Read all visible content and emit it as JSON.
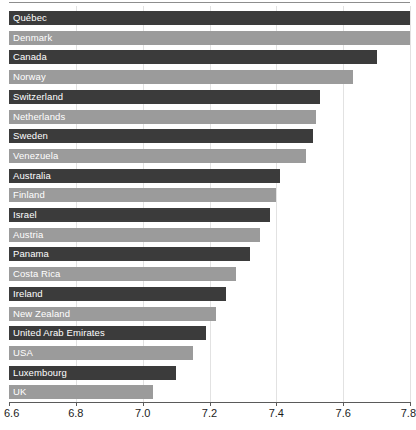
{
  "chart_data": {
    "type": "bar",
    "orientation": "horizontal",
    "title": "",
    "subtitle": "",
    "xlabel": "",
    "ylabel": "",
    "xlim": [
      6.6,
      7.8
    ],
    "xticks": [
      "6.6",
      "6.8",
      "7.0",
      "7.2",
      "7.4",
      "7.6",
      "7.8"
    ],
    "xtick_values": [
      6.6,
      6.8,
      7.0,
      7.2,
      7.4,
      7.6,
      7.8
    ],
    "grid": true,
    "grid_axis": "x",
    "legend": "none",
    "labels_inside_bars": true,
    "categories": [
      "Québec",
      "Denmark",
      "Canada",
      "Norway",
      "Switzerland",
      "Netherlands",
      "Sweden",
      "Venezuela",
      "Australia",
      "Finland",
      "Israel",
      "Austria",
      "Panama",
      "Costa Rica",
      "Ireland",
      "New Zealand",
      "United Arab Emirates",
      "USA",
      "Luxembourg",
      "UK"
    ],
    "values": [
      7.8,
      7.8,
      7.7,
      7.63,
      7.53,
      7.52,
      7.51,
      7.49,
      7.41,
      7.4,
      7.38,
      7.35,
      7.32,
      7.28,
      7.25,
      7.22,
      7.19,
      7.15,
      7.1,
      7.03
    ],
    "bar_colors": [
      "dark",
      "light",
      "dark",
      "light",
      "dark",
      "light",
      "dark",
      "light",
      "dark",
      "light",
      "dark",
      "light",
      "dark",
      "light",
      "dark",
      "light",
      "dark",
      "light",
      "dark",
      "light"
    ]
  },
  "colors": {
    "bar_dark": "#3b3b3b",
    "bar_light": "#9b9b9b",
    "grid": "#e2e2e2",
    "axis": "#5a5a5a",
    "label_text": "#ffffff",
    "tick_text": "#1b1b1b",
    "background": "#ffffff"
  }
}
